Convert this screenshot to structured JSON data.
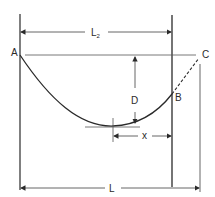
{
  "diagram": {
    "type": "cable sag diagram",
    "labels": {
      "point_a": "A",
      "point_b": "B",
      "point_c": "C",
      "sag_depth": "D",
      "horizontal_offset": "x",
      "span_total": "L",
      "span_half_main": "L",
      "span_half_sub": "2"
    },
    "colors": {
      "line": "#2a2a2a",
      "thin": "#555555",
      "background": "#ffffff"
    }
  }
}
